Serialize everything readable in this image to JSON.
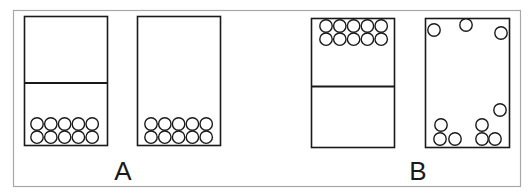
{
  "figure": {
    "panels": [
      {
        "label": "A",
        "containers": [
          {
            "name": "container-with-partition",
            "has_partition": true,
            "particles": {
              "arrangement": "packed-bottom",
              "count": 10,
              "rows": 2,
              "per_row": 5
            }
          },
          {
            "name": "container-open",
            "has_partition": false,
            "particles": {
              "arrangement": "packed-bottom",
              "count": 10,
              "rows": 2,
              "per_row": 5
            }
          }
        ]
      },
      {
        "label": "B",
        "containers": [
          {
            "name": "container-with-partition",
            "has_partition": true,
            "particles": {
              "arrangement": "packed-top",
              "count": 10,
              "rows": 2,
              "per_row": 5
            }
          },
          {
            "name": "container-open",
            "has_partition": false,
            "particles": {
              "arrangement": "scattered",
              "count": 10
            }
          }
        ]
      }
    ],
    "colors": {
      "stroke": "#1a1a1a",
      "frame": "#9a9a9a",
      "background": "#ffffff"
    }
  }
}
